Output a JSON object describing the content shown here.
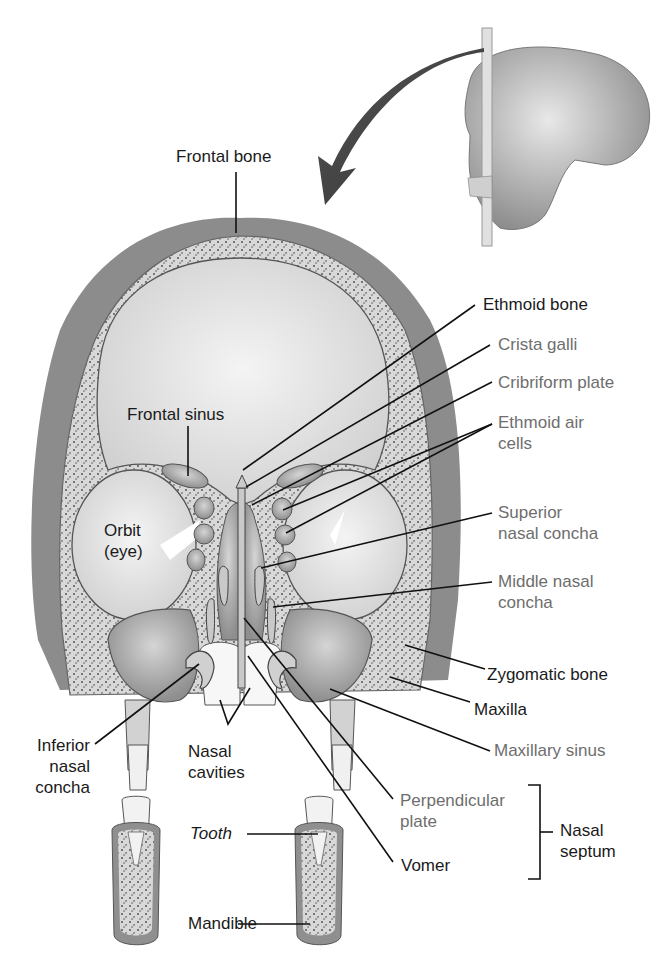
{
  "figure": {
    "colors": {
      "background": "#ffffff",
      "label_primary": "#1a1a1a",
      "label_secondary": "#6e6e6e",
      "skin_outer": "#8a8a8a",
      "bone_fill": "#d6d6d6",
      "cavity_fill": "#e9e9e9",
      "leader_line": "#111111"
    },
    "inset": {
      "description": "Lateral view of skull with coronal cutting plane; curved arrow points to section"
    },
    "labels": {
      "frontal_bone": "Frontal bone",
      "ethmoid_bone": "Ethmoid bone",
      "crista_galli": "Crista galli",
      "cribriform_plate": "Cribriform plate",
      "ethmoid_air_cells": [
        "Ethmoid air",
        "cells"
      ],
      "frontal_sinus": "Frontal sinus",
      "orbit": [
        "Orbit",
        "(eye)"
      ],
      "superior_nasal_concha": [
        "Superior",
        "nasal concha"
      ],
      "middle_nasal_concha": [
        "Middle nasal",
        "concha"
      ],
      "zygomatic_bone": "Zygomatic bone",
      "maxilla": "Maxilla",
      "maxillary_sinus": "Maxillary sinus",
      "inferior_nasal_concha": [
        "Inferior",
        "nasal",
        "concha"
      ],
      "nasal_cavities": [
        "Nasal",
        "cavities"
      ],
      "perpendicular_plate": [
        "Perpendicular",
        "plate"
      ],
      "vomer": "Vomer",
      "nasal_septum": [
        "Nasal",
        "septum"
      ],
      "tooth": "Tooth",
      "mandible": "Mandible"
    }
  }
}
